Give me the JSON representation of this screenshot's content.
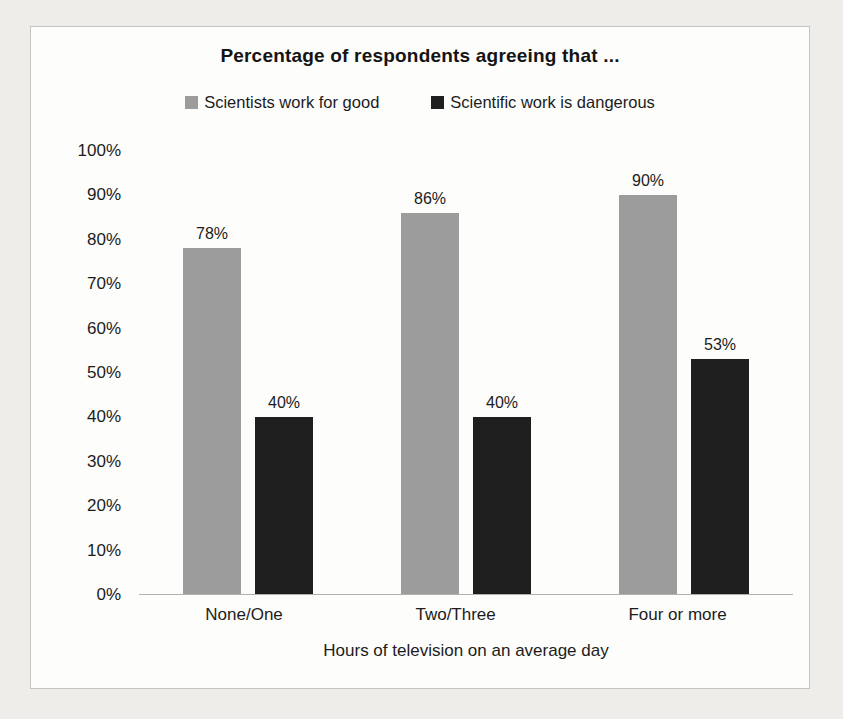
{
  "page": {
    "background_color": "#efede9",
    "frame_background_color": "#fdfdfb",
    "frame_border_color": "#c7c5c0",
    "axis_line_color": "#b3b1ac",
    "text_color": "#1c1c1c"
  },
  "chart_data": {
    "type": "bar",
    "title": "Percentage of respondents agreeing that ...",
    "xlabel": "Hours of television on an average day",
    "ylabel": "",
    "categories": [
      "None/One",
      "Two/Three",
      "Four or more"
    ],
    "series": [
      {
        "name": "Scientists work for good",
        "color": "#9c9c9c",
        "values": [
          78,
          86,
          90
        ],
        "labels": [
          "78%",
          "86%",
          "90%"
        ]
      },
      {
        "name": "Scientific work is dangerous",
        "color": "#1f1f1f",
        "values": [
          40,
          40,
          53
        ],
        "labels": [
          "40%",
          "40%",
          "53%"
        ]
      }
    ],
    "ylim": [
      0,
      100
    ],
    "ytick_step": 10,
    "ytick_labels": [
      "0%",
      "10%",
      "20%",
      "30%",
      "40%",
      "50%",
      "60%",
      "70%",
      "80%",
      "90%",
      "100%"
    ],
    "grid": false,
    "legend_position": "top"
  }
}
